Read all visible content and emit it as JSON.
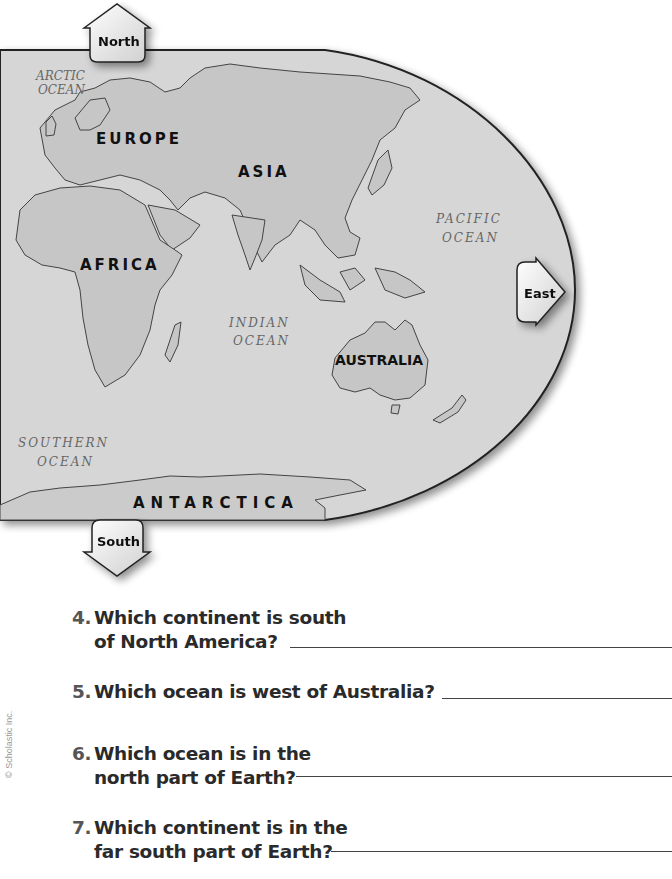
{
  "map": {
    "compass": {
      "north": "North",
      "south": "South",
      "east": "East"
    },
    "continents": {
      "europe": "EUROPE",
      "asia": "ASIA",
      "africa": "AFRICA",
      "australia": "AUSTRALIA",
      "antarctica": "ANTARCTICA"
    },
    "oceans": {
      "arctic_line1": "ARCTIC",
      "arctic_line2": "OCEAN",
      "pacific_line1": "PACIFIC",
      "pacific_line2": "OCEAN",
      "indian_line1": "INDIAN",
      "indian_line2": "OCEAN",
      "southern_line1": "SOUTHERN",
      "southern_line2": "OCEAN"
    },
    "colors": {
      "ocean": "#d6d6d6",
      "land": "#c4c4c4",
      "outline": "#333333"
    }
  },
  "questions": [
    {
      "number": "4.",
      "line1": "Which continent is south",
      "line2": "of North America?",
      "answer": ""
    },
    {
      "number": "5.",
      "line1": "Which ocean is west of Australia?",
      "line2": "",
      "answer": ""
    },
    {
      "number": "6.",
      "line1": "Which ocean is in the",
      "line2": "north part of Earth?",
      "answer": ""
    },
    {
      "number": "7.",
      "line1": "Which continent is in the",
      "line2": "far south part of Earth?",
      "answer": ""
    }
  ],
  "footer": {
    "copyright": "© Scholastic Inc."
  }
}
